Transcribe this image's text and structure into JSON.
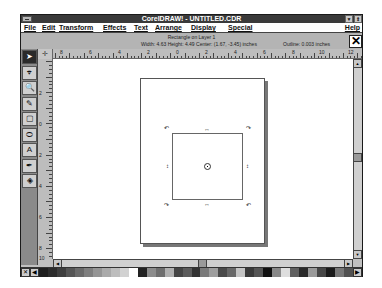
{
  "window": {
    "title": "CorelDRAW! - UNTITLED.CDR",
    "buttons": {
      "minimize": "▼",
      "restore": "⇕"
    }
  },
  "menubar": {
    "items": [
      {
        "label": "File",
        "x": 3
      },
      {
        "label": "Edit",
        "x": 21
      },
      {
        "label": "Transform",
        "x": 38
      },
      {
        "label": "Effects",
        "x": 82
      },
      {
        "label": "Text",
        "x": 113
      },
      {
        "label": "Arrange",
        "x": 134
      },
      {
        "label": "Display",
        "x": 170
      },
      {
        "label": "Special",
        "x": 207
      }
    ],
    "help": "Help"
  },
  "status": {
    "object": "Rectangle on Layer 1",
    "dimensions": "Width: 4.63  Height: 4.49  Center: (1.67, -3.45)  inches",
    "outline": "Outline: 0.003 inches",
    "close_glyph": "✕"
  },
  "ruler": {
    "corner_glyph": "✛",
    "h_labels": [
      {
        "text": "8",
        "x": 22
      },
      {
        "text": "6",
        "x": 51
      },
      {
        "text": "4",
        "x": 80
      },
      {
        "text": "2",
        "x": 109
      },
      {
        "text": "0",
        "x": 138
      },
      {
        "text": "2",
        "x": 167
      },
      {
        "text": "4",
        "x": 196
      },
      {
        "text": "6",
        "x": 225
      },
      {
        "text": "8",
        "x": 254
      },
      {
        "text": "10",
        "x": 281
      },
      {
        "text": "12",
        "x": 310
      }
    ],
    "v_labels": [
      {
        "text": "2",
        "y": 31
      },
      {
        "text": "0",
        "y": 62
      },
      {
        "text": "2",
        "y": 93
      },
      {
        "text": "4",
        "y": 124
      },
      {
        "text": "6",
        "y": 155
      },
      {
        "text": "8",
        "y": 186
      },
      {
        "text": "10",
        "y": 196
      }
    ]
  },
  "toolbox": {
    "tools": [
      {
        "name": "pick-tool",
        "glyph": "➤",
        "active": true
      },
      {
        "name": "shape-tool",
        "glyph": "⌖"
      },
      {
        "name": "zoom-tool",
        "glyph": "🔍"
      },
      {
        "name": "pencil-tool",
        "glyph": "✎"
      },
      {
        "name": "rectangle-tool",
        "glyph": "▢"
      },
      {
        "name": "ellipse-tool",
        "glyph": "⬭"
      },
      {
        "name": "text-tool",
        "glyph": "A"
      },
      {
        "name": "outline-tool",
        "glyph": "✒"
      },
      {
        "name": "fill-tool",
        "glyph": "◈"
      }
    ]
  },
  "selection": {
    "rotate_glyph_tl": "↶",
    "rotate_glyph_tr": "↷",
    "skew_h": "↔",
    "skew_v": "↕"
  },
  "scroll": {
    "up": "▲",
    "down": "▼",
    "left": "◀",
    "right": "▶"
  },
  "palette": {
    "no_color": "✕",
    "left_arrow": "◀",
    "right_arrow": "▶",
    "colors": [
      "#1e1e1e",
      "#2c2c2c",
      "#3e3e3e",
      "#555555",
      "#6a6a6a",
      "#7f7f7f",
      "#959595",
      "#aaaaaa",
      "#bdbdbd",
      "#d2d2d2",
      "#ffffff",
      "#222222",
      "#8c8c8c",
      "#6e6e6e",
      "#b0b0b0",
      "#454545",
      "#5c5c5c",
      "#333333",
      "#7a7a7a",
      "#9e9e9e",
      "#4a4a4a",
      "#686868",
      "#c4c4c4",
      "#3a3a3a",
      "#555555",
      "#111111",
      "#888888",
      "#dddddd",
      "#606060",
      "#2a2a2a",
      "#9a9a9a",
      "#474747",
      "#1a1a1a",
      "#777777",
      "#515151"
    ]
  }
}
